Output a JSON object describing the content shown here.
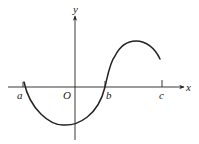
{
  "figure": {
    "axes": {
      "x_label": "x",
      "y_label": "y",
      "origin_label": "O"
    },
    "ticks": {
      "a": "a",
      "b": "b",
      "c": "c"
    },
    "colors": {
      "background": "#ffffff",
      "stroke": "#222222"
    }
  },
  "curve": {
    "starts_at": "a (on x-axis)",
    "minimum": "between a and O, below x-axis, slightly left of y-axis",
    "crosses_x_axis_at": "b",
    "maximum": "between b and c, above x-axis",
    "ends": "just before c, above x-axis"
  }
}
